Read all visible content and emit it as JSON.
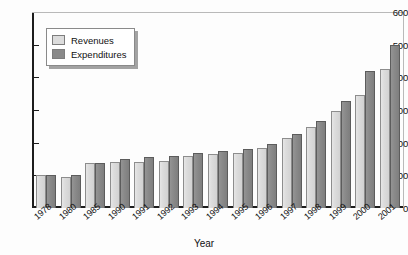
{
  "chart_data": {
    "type": "bar",
    "title": "",
    "xlabel": "Year",
    "ylabel": "",
    "ylim": [
      0,
      600
    ],
    "yticks": [
      0,
      100,
      200,
      300,
      400,
      500,
      600
    ],
    "grid": false,
    "legend_position": "top-left",
    "categories": [
      "1978",
      "1980",
      "1985",
      "1990",
      "1991",
      "1992",
      "1993",
      "1994",
      "1995",
      "1996",
      "1997",
      "1998",
      "1999",
      "2000",
      "2001"
    ],
    "series": [
      {
        "name": "Revenues",
        "color": "#dcdcdc",
        "values": [
          100,
          95,
          137,
          140,
          140,
          145,
          158,
          165,
          168,
          185,
          215,
          247,
          297,
          347,
          425
        ]
      },
      {
        "name": "Expenditures",
        "color": "#8a8a8a",
        "values": [
          100,
          102,
          137,
          150,
          155,
          160,
          168,
          175,
          180,
          195,
          228,
          265,
          327,
          420,
          500
        ]
      }
    ]
  },
  "legend": {
    "items": [
      {
        "label": "Revenues",
        "swatch": "rev"
      },
      {
        "label": "Expenditures",
        "swatch": "exp"
      }
    ]
  }
}
